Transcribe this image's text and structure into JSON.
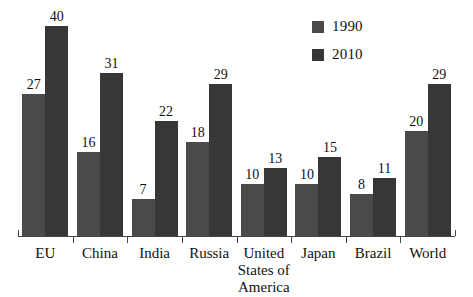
{
  "chart_data": {
    "type": "bar",
    "title": "",
    "subtitle": "",
    "xlabel": "",
    "ylabel": "",
    "categories": [
      "EU",
      "China",
      "India",
      "Russia",
      "United States of America",
      "Japan",
      "Brazil",
      "World"
    ],
    "series": [
      {
        "name": "1990",
        "color": "#4a4a4a",
        "values": [
          27,
          16,
          7,
          18,
          10,
          10,
          8,
          20
        ]
      },
      {
        "name": "2010",
        "color": "#373737",
        "values": [
          40,
          31,
          22,
          29,
          13,
          15,
          11,
          29
        ]
      }
    ],
    "ylim": [
      0,
      40
    ],
    "grid": false,
    "legend_position": "top-right",
    "value_labels": true,
    "axis_color": "#444444"
  },
  "legend": {
    "items": [
      {
        "label": "1990",
        "color": "#4a4a4a"
      },
      {
        "label": "2010",
        "color": "#373737"
      }
    ]
  }
}
